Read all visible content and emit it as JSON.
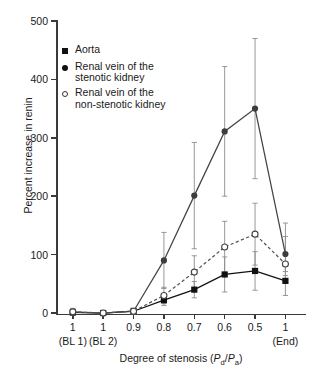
{
  "chart_data": {
    "type": "line",
    "title": "",
    "xlabel": "Degree of stenosis (Pd/Pa)",
    "ylabel": "Percent increase in renin",
    "categories": [
      "1",
      "1",
      "0.9",
      "0.8",
      "0.7",
      "0.6",
      "0.5",
      "1"
    ],
    "category_sublabels": [
      "(BL 1)",
      "(BL 2)",
      "",
      "",
      "",
      "",
      "",
      "(End)"
    ],
    "ylim": [
      0,
      500
    ],
    "yticks": [
      0,
      100,
      200,
      300,
      400,
      500
    ],
    "grid": false,
    "legend_position": "upper-left-inside",
    "series": [
      {
        "name": "Aorta",
        "marker": "filled-square",
        "line": "solid",
        "color": "#111111",
        "values": [
          1,
          0,
          3,
          22,
          40,
          66,
          72,
          55
        ],
        "err_low": [
          4,
          3,
          5,
          9,
          14,
          30,
          33,
          25
        ],
        "err_high": [
          4,
          3,
          5,
          9,
          14,
          30,
          33,
          25
        ]
      },
      {
        "name": "Renal vein of the stenotic kidney",
        "marker": "filled-circle",
        "line": "solid",
        "color": "#444444",
        "values": [
          2,
          0,
          3,
          90,
          201,
          311,
          350,
          101
        ],
        "err_low": [
          5,
          3,
          5,
          48,
          91,
          111,
          120,
          30
        ],
        "err_high": [
          5,
          3,
          5,
          48,
          91,
          111,
          120,
          30
        ]
      },
      {
        "name": "Renal vein of the non-stenotic kidney",
        "marker": "open-circle",
        "line": "dashed",
        "color": "#555555",
        "values": [
          2,
          0,
          3,
          30,
          70,
          113,
          135,
          84
        ],
        "err_low": [
          6,
          3,
          5,
          14,
          28,
          44,
          53,
          20
        ],
        "err_high": [
          6,
          3,
          5,
          14,
          28,
          44,
          53,
          70
        ]
      }
    ]
  },
  "axis": {
    "y_title": "Percent increase in renin",
    "x_title_pre": "Degree of stenosis (",
    "x_title_p1": "P",
    "x_title_sub1": "d",
    "x_title_slash": "/",
    "x_title_p2": "P",
    "x_title_sub2": "a",
    "x_title_post": ")"
  },
  "legend": {
    "items": [
      {
        "marker": "filled-square",
        "label": "Aorta"
      },
      {
        "marker": "filled-circle",
        "label": "Renal vein of the\nstenotic kidney"
      },
      {
        "marker": "open-circle",
        "label": "Renal vein of the\nnon-stenotic kidney"
      }
    ]
  }
}
